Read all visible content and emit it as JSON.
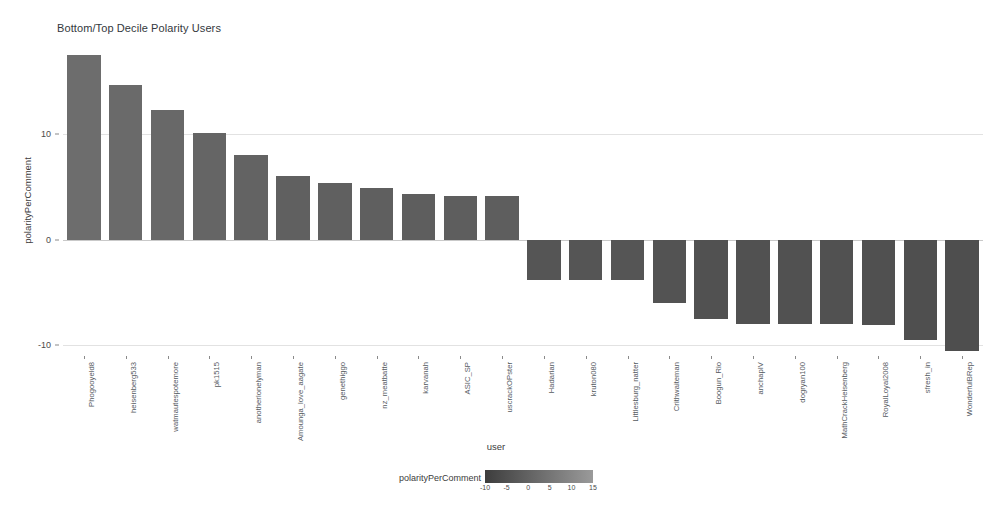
{
  "chart_data": {
    "type": "bar",
    "title": "Bottom/Top Decile Polarity Users",
    "xlabel": "user",
    "ylabel": "polarityPerComment",
    "ylim": [
      -11,
      18.5
    ],
    "yticks": [
      10,
      0,
      -10
    ],
    "ytick_labels": [
      "10",
      "0",
      "-10"
    ],
    "grid": true,
    "categories": [
      "Phogooyeld8",
      "heisenberg533",
      "watmautespotemore",
      "pk1515",
      "anotherlonelyman",
      "Amounga_love_aagate",
      "genethiggo",
      "nz_meatbatte",
      "karvanah",
      "ASIC_SP",
      "uscrackOPster",
      "Hadarian",
      "kruton080",
      "Littlesburg_natter",
      "Crithwaiteman",
      "Boogun_Rio",
      "anchapIV",
      "dogryan100",
      "MathCrackHeisenberg",
      "RoyalLoyal2008",
      "sfresh_in",
      "WonderfulBRep"
    ],
    "values": [
      17.5,
      14.6,
      12.3,
      10.1,
      8.0,
      6.0,
      5.4,
      4.9,
      4.3,
      4.1,
      4.1,
      -3.8,
      -3.8,
      -3.8,
      -6.0,
      -7.5,
      -8.0,
      -8.0,
      -8.0,
      -8.1,
      -9.5,
      -10.5
    ],
    "legend": {
      "title": "polarityPerComment",
      "position": "bottom",
      "ticks": [
        -10,
        -5,
        0,
        5,
        10,
        15
      ],
      "tick_labels": [
        "-10",
        "-5",
        "0",
        "5",
        "10",
        "15"
      ],
      "gradient_from": "#3d3d3d",
      "gradient_to": "#9a9a9a",
      "domain": [
        -12,
        18
      ]
    },
    "colors": {
      "bar_high": "#6e6e6e",
      "bar_low": "#4c4c4c",
      "gridline": "#e2e2e2",
      "zero_line": "#c9c9c9",
      "axis_text": "#4a4a4a",
      "title_text": "#33383d"
    }
  }
}
